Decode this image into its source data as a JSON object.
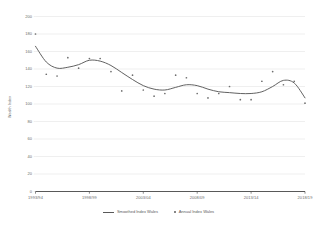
{
  "chart_data": {
    "type": "line",
    "title": "",
    "xlabel": "",
    "ylabel": "Wealth Index",
    "ylim": [
      0,
      200
    ],
    "ytick_step": 20,
    "yticks": [
      "200",
      "180",
      "160",
      "140",
      "120",
      "100",
      "80",
      "60",
      "40",
      "20",
      "0"
    ],
    "xticks": [
      "1993/94",
      "1998/99",
      "2003/04",
      "2008/09",
      "2013/14",
      "2018/19"
    ],
    "x": [
      "1993/94",
      "1994/95",
      "1995/96",
      "1996/97",
      "1997/98",
      "1998/99",
      "1999/00",
      "2000/01",
      "2001/02",
      "2002/03",
      "2003/04",
      "2004/05",
      "2005/06",
      "2006/07",
      "2007/08",
      "2008/09",
      "2009/10",
      "2010/11",
      "2011/12",
      "2012/13",
      "2013/14",
      "2014/15",
      "2015/16",
      "2016/17",
      "2017/18",
      "2018/19"
    ],
    "grid": true,
    "legend_position": "bottom",
    "series": [
      {
        "name": "Smoothed Index Wales",
        "render": "line",
        "color": "#595959",
        "values": [
          166,
          148,
          141,
          142,
          145,
          150,
          149,
          144,
          136,
          128,
          121,
          117,
          116,
          119,
          122,
          121,
          117,
          114,
          113,
          112,
          112,
          114,
          120,
          127,
          124,
          107
        ]
      },
      {
        "name": "Annual Index Wales",
        "render": "scatter",
        "color": "#6e6e6e",
        "values": [
          180,
          134,
          132,
          153,
          141,
          152,
          152,
          137,
          115,
          133,
          116,
          109,
          112,
          133,
          130,
          112,
          107,
          112,
          120,
          105,
          105,
          126,
          137,
          122,
          126,
          101
        ]
      }
    ]
  },
  "legend": {
    "smoothed_label": "Smoothed Index Wales",
    "annual_label": "Annual Index Wales"
  },
  "colors": {
    "line": "#595959",
    "marker": "#6e6e6e",
    "grid": "#e4e4e4",
    "axis": "#595959",
    "text": "#6b6b6b"
  }
}
